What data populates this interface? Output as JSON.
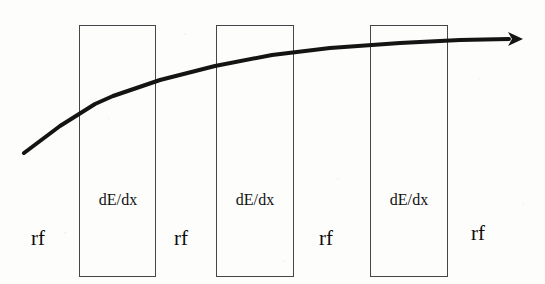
{
  "figure": {
    "width": 545,
    "height": 284,
    "background_color": "#fdfdfb",
    "ink_color": "#111111",
    "box_stroke_color": "#46464a",
    "curve_color": "#141414"
  },
  "absorber_boxes": [
    {
      "label": "dE/dx",
      "x": 79,
      "y": 25,
      "width": 77,
      "height": 252
    },
    {
      "label": "dE/dx",
      "x": 216,
      "y": 25,
      "width": 78,
      "height": 252
    },
    {
      "label": "dE/dx",
      "x": 370,
      "y": 25,
      "width": 78,
      "height": 252
    }
  ],
  "dedx_labels": [
    {
      "text": "dE/dx",
      "x": 85,
      "y": 191,
      "width": 66
    },
    {
      "text": "dE/dx",
      "x": 222,
      "y": 191,
      "width": 66
    },
    {
      "text": "dE/dx",
      "x": 376,
      "y": 191,
      "width": 66
    }
  ],
  "rf_labels": [
    {
      "text": "rf",
      "x": 31,
      "y": 226
    },
    {
      "text": "rf",
      "x": 174,
      "y": 226
    },
    {
      "text": "rf",
      "x": 319,
      "y": 226
    },
    {
      "text": "rf",
      "x": 471,
      "y": 221
    }
  ],
  "energy_curve": {
    "description": "rising beam-energy trajectory with arrowhead",
    "stroke_width": 4,
    "points": [
      {
        "x": 24,
        "y": 153
      },
      {
        "x": 60,
        "y": 126
      },
      {
        "x": 95,
        "y": 104
      },
      {
        "x": 113,
        "y": 96
      },
      {
        "x": 160,
        "y": 80
      },
      {
        "x": 215,
        "y": 66
      },
      {
        "x": 272,
        "y": 55
      },
      {
        "x": 330,
        "y": 48
      },
      {
        "x": 400,
        "y": 43
      },
      {
        "x": 460,
        "y": 40
      },
      {
        "x": 509,
        "y": 39
      }
    ],
    "arrowhead": {
      "tip_x": 523,
      "tip_y": 39,
      "length": 15,
      "half_width": 7
    }
  }
}
